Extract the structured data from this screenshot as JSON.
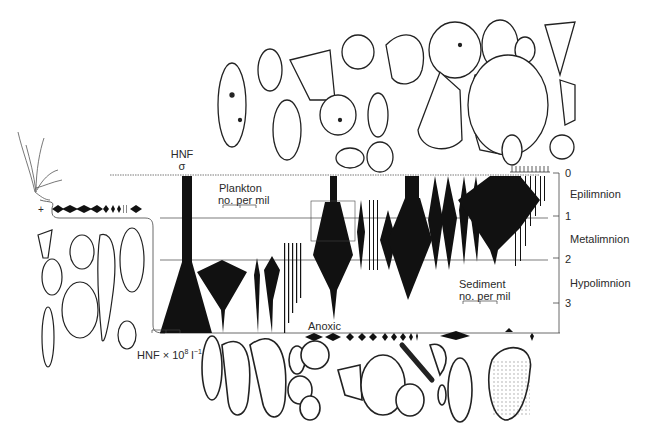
{
  "figure": {
    "colors": {
      "ink": "#111111",
      "line": "#444444",
      "background": "#ffffff"
    }
  },
  "depth_axis": {
    "ticks": [
      "0",
      "1",
      "2",
      "3"
    ],
    "zones": [
      "Epilimnion",
      "Metalimnion",
      "Hypolimnion"
    ]
  },
  "labels": {
    "hnf_title": "HNF",
    "hnf_sigma": "σ",
    "plankton_line1": "Plankton",
    "plankton_line2": "no. per mil",
    "sediment_line1": "Sediment",
    "sediment_line2": "no. per mil",
    "anoxic": "Anoxic",
    "hnf_scale": "HNF × 10",
    "hnf_scale_exp": "8",
    "hnf_scale_unit": " l",
    "hnf_scale_unit_exp": "−1",
    "littoral_plus": "+"
  },
  "icons": {
    "plant": "grass-plant-icon",
    "ciliates_top": "planktonic-ciliate-drawings",
    "ciliates_left": "littoral-ciliate-drawings",
    "ciliates_bottom": "benthic-ciliate-drawings"
  }
}
